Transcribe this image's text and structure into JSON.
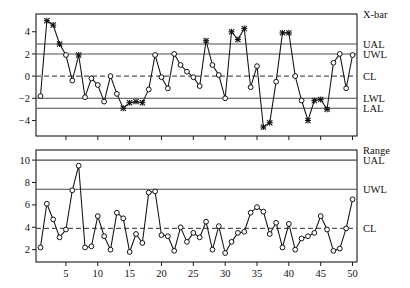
{
  "chart_data": [
    {
      "type": "line",
      "id": "xbar-chart",
      "title": "X-bar",
      "xlabel": "",
      "ylabel": "",
      "xlim": [
        0.3,
        50.7
      ],
      "ylim": [
        -5.4,
        5.6
      ],
      "xticks": [
        5,
        10,
        15,
        20,
        25,
        30,
        35,
        40,
        45,
        50
      ],
      "yticks": [
        -4,
        -2,
        0,
        2,
        4
      ],
      "grid": false,
      "legend_position": "right-outside",
      "limit_lines": [
        {
          "label": "UAL",
          "value": 2.9
        },
        {
          "label": "UWL",
          "value": 2.0
        },
        {
          "label": "CL",
          "value": 0.0,
          "style": "dashed"
        },
        {
          "label": "LWL",
          "value": -2.0
        },
        {
          "label": "LAL",
          "value": -2.9
        }
      ],
      "x": [
        1,
        2,
        3,
        4,
        5,
        6,
        7,
        8,
        9,
        10,
        11,
        12,
        13,
        14,
        15,
        16,
        17,
        18,
        19,
        20,
        21,
        22,
        23,
        24,
        25,
        26,
        27,
        28,
        29,
        30,
        31,
        32,
        33,
        34,
        35,
        36,
        37,
        38,
        39,
        40,
        41,
        42,
        43,
        44,
        45,
        46,
        47,
        48,
        49,
        50
      ],
      "values": [
        -1.8,
        5.0,
        4.6,
        2.9,
        1.9,
        -0.4,
        1.9,
        -1.9,
        -0.2,
        -0.8,
        -2.3,
        0.0,
        -1.6,
        -2.9,
        -2.4,
        -2.3,
        -2.4,
        -1.2,
        1.9,
        -0.1,
        -1.1,
        2.0,
        1.0,
        0.4,
        -0.1,
        -0.9,
        3.2,
        1.0,
        0.1,
        -2.0,
        4.0,
        3.3,
        4.3,
        -1.0,
        0.9,
        -4.6,
        -4.2,
        -0.5,
        3.9,
        3.9,
        0.0,
        -2.2,
        -4.0,
        -2.2,
        -2.1,
        -3.0,
        1.2,
        2.0,
        -1.1,
        1.9
      ],
      "marker_styles": [
        "o",
        "x",
        "x",
        "x",
        "o",
        "o",
        "x",
        "o",
        "o",
        "o",
        "o",
        "o",
        "o",
        "x",
        "x",
        "x",
        "x",
        "o",
        "o",
        "o",
        "o",
        "o",
        "o",
        "o",
        "o",
        "o",
        "x",
        "o",
        "o",
        "o",
        "x",
        "x",
        "x",
        "o",
        "o",
        "x",
        "x",
        "o",
        "x",
        "x",
        "o",
        "o",
        "x",
        "x",
        "x",
        "x",
        "o",
        "o",
        "o",
        "o"
      ],
      "marker_note": "o = in-control circle, x = out-of-control asterisk/star"
    },
    {
      "type": "line",
      "id": "range-chart",
      "title": "Range",
      "xlabel": "",
      "ylabel": "",
      "xlim": [
        0.3,
        50.7
      ],
      "ylim": [
        0.9,
        10.9
      ],
      "xticks": [
        5,
        10,
        15,
        20,
        25,
        30,
        35,
        40,
        45,
        50
      ],
      "yticks": [
        2,
        4,
        6,
        8,
        10
      ],
      "grid": false,
      "legend_position": "right-outside",
      "limit_lines": [
        {
          "label": "UAL",
          "value": 10.0
        },
        {
          "label": "UWL",
          "value": 7.4
        },
        {
          "label": "CL",
          "value": 3.9,
          "style": "dashed"
        }
      ],
      "x": [
        1,
        2,
        3,
        4,
        5,
        6,
        7,
        8,
        9,
        10,
        11,
        12,
        13,
        14,
        15,
        16,
        17,
        18,
        19,
        20,
        21,
        22,
        23,
        24,
        25,
        26,
        27,
        28,
        29,
        30,
        31,
        32,
        33,
        34,
        35,
        36,
        37,
        38,
        39,
        40,
        41,
        42,
        43,
        44,
        45,
        46,
        47,
        48,
        49,
        50
      ],
      "values": [
        2.2,
        6.1,
        4.7,
        3.1,
        3.8,
        7.3,
        9.5,
        2.2,
        2.3,
        5.0,
        3.2,
        2.0,
        5.3,
        4.8,
        1.8,
        3.4,
        2.6,
        7.1,
        7.2,
        3.3,
        3.2,
        1.9,
        4.0,
        2.7,
        3.5,
        3.1,
        4.5,
        2.0,
        4.1,
        1.7,
        2.7,
        3.5,
        3.6,
        5.3,
        5.8,
        5.4,
        3.4,
        4.4,
        2.2,
        4.3,
        2.0,
        3.0,
        3.2,
        3.5,
        5.0,
        3.8,
        1.9,
        2.1,
        3.9,
        6.5
      ],
      "marker_styles": [
        "o",
        "o",
        "o",
        "o",
        "o",
        "o",
        "o",
        "o",
        "o",
        "o",
        "o",
        "o",
        "o",
        "o",
        "o",
        "o",
        "o",
        "o",
        "o",
        "o",
        "o",
        "o",
        "o",
        "o",
        "o",
        "o",
        "o",
        "o",
        "o",
        "o",
        "o",
        "o",
        "o",
        "o",
        "o",
        "o",
        "o",
        "o",
        "o",
        "o",
        "o",
        "o",
        "o",
        "o",
        "o",
        "o",
        "o",
        "o",
        "o",
        "o"
      ]
    }
  ],
  "right_labels": {
    "top": [
      "X-bar",
      "UAL",
      "UWL",
      "CL",
      "LWL",
      "LAL"
    ],
    "bottom": [
      "Range",
      "UAL",
      "UWL",
      "CL"
    ]
  }
}
